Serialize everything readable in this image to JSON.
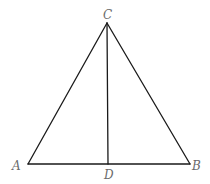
{
  "diagram": {
    "type": "geometry-triangle",
    "points": {
      "A": {
        "label": "A",
        "x": 28,
        "y": 164
      },
      "B": {
        "label": "B",
        "x": 190,
        "y": 164
      },
      "C": {
        "label": "C",
        "x": 107,
        "y": 23
      },
      "D": {
        "label": "D",
        "x": 108,
        "y": 164
      }
    },
    "segments": [
      {
        "from": "A",
        "to": "C"
      },
      {
        "from": "C",
        "to": "B"
      },
      {
        "from": "A",
        "to": "B"
      },
      {
        "from": "C",
        "to": "D"
      }
    ],
    "colors": {
      "line": "#1a1a1a",
      "label": "#6b6b6b",
      "background": "#ffffff"
    }
  }
}
